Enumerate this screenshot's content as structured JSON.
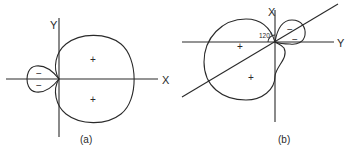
{
  "figure_a": {
    "caption": "(a)",
    "axis_x_label": "X",
    "axis_y_label": "Y",
    "large_lobe_signs": [
      "+",
      "+"
    ],
    "small_lobe_signs": [
      "−",
      "−"
    ]
  },
  "figure_b": {
    "caption": "(b)",
    "axis_x_label": "X",
    "axis_y_label": "Y",
    "angle_label": "120°",
    "large_lobe_signs": [
      "+",
      "+"
    ],
    "small_lobe_signs": [
      "−",
      "−"
    ]
  },
  "colors": {
    "line": "#2a2a2a",
    "background": "#ffffff"
  }
}
